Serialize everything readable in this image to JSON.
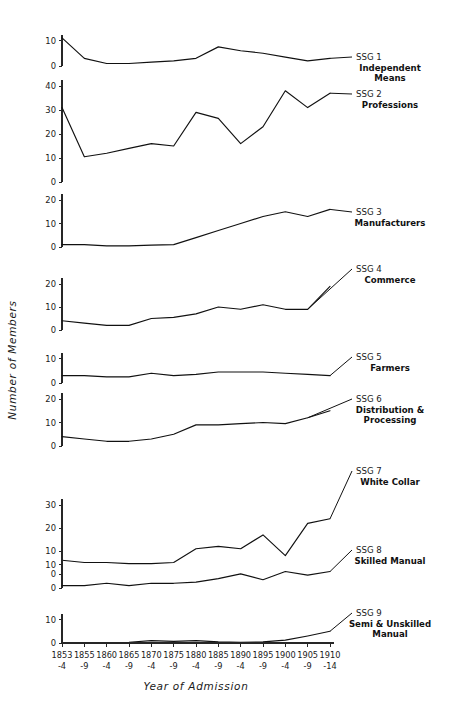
{
  "chart_data": {
    "type": "line",
    "title": "",
    "xlabel": "Year of Admission",
    "ylabel": "Number of Members",
    "grid": false,
    "legend_position": "right-inline",
    "categories": [
      "1853\n-4",
      "1855\n-9",
      "1860\n-4",
      "1865\n-9",
      "1870\n-4",
      "1875\n-9",
      "1880\n-4",
      "1885\n-9",
      "1890\n-4",
      "1895\n-9",
      "1900\n-4",
      "1905\n-9",
      "1910\n-14"
    ],
    "xticks_top": [
      "1853",
      "1855",
      "1860",
      "1865",
      "1870",
      "1875",
      "1880",
      "1885",
      "1890",
      "1895",
      "1900",
      "1905",
      "1910"
    ],
    "xticks_bottom": [
      "-4",
      "-9",
      "-4",
      "-9",
      "-4",
      "-9",
      "-4",
      "-9",
      "-4",
      "-9",
      "-4",
      "-9",
      "-14"
    ],
    "panels": [
      {
        "code": "SSG 1",
        "name": "Independent\nMeans",
        "name_lines": [
          "Independent",
          "Means"
        ],
        "yticks": [
          0,
          10
        ],
        "ylim": [
          0,
          13
        ],
        "values": [
          11,
          3,
          1,
          1,
          1.5,
          2,
          3,
          7.5,
          6,
          5,
          3.5,
          2,
          3
        ]
      },
      {
        "code": "SSG 2",
        "name": "Professions",
        "name_lines": [
          "Professions"
        ],
        "yticks": [
          0,
          10,
          20,
          30,
          40
        ],
        "ylim": [
          0,
          44
        ],
        "values": [
          31,
          10.5,
          12,
          14,
          16,
          15,
          29,
          26.5,
          16,
          23,
          38,
          31,
          37
        ]
      },
      {
        "code": "SSG 3",
        "name": "Manufacturers",
        "name_lines": [
          "Manufacturers"
        ],
        "yticks": [
          0,
          10,
          20
        ],
        "ylim": [
          0,
          22
        ],
        "values": [
          1,
          1,
          0.5,
          0.5,
          0.8,
          1,
          4,
          7,
          10,
          13,
          15,
          13,
          16
        ]
      },
      {
        "code": "SSG 4",
        "name": "Commerce",
        "name_lines": [
          "Commerce"
        ],
        "yticks": [
          0,
          10,
          20
        ],
        "ylim": [
          0,
          22
        ],
        "values": [
          4,
          3,
          2,
          2,
          5,
          5.5,
          7,
          10,
          9,
          11,
          9,
          9,
          19
        ]
      },
      {
        "code": "SSG 5",
        "name": "Farmers",
        "name_lines": [
          "Farmers"
        ],
        "yticks": [
          0,
          10
        ],
        "ylim": [
          0,
          12
        ],
        "values": [
          3,
          3,
          2.5,
          2.5,
          4,
          3,
          3.5,
          4.5,
          4.5,
          4.5,
          4,
          3.5,
          3
        ]
      },
      {
        "code": "SSG 6",
        "name": "Distribution &\nProcessing",
        "name_lines": [
          "Distribution &",
          "Processing"
        ],
        "yticks": [
          0,
          10,
          20
        ],
        "ylim": [
          0,
          22
        ],
        "values": [
          4,
          3,
          2,
          2,
          3,
          5,
          9,
          9,
          9.5,
          10,
          9.5,
          12,
          15
        ]
      },
      {
        "code": "SSG 7",
        "name": "White Collar",
        "name_lines": [
          "White Collar"
        ],
        "yticks": [
          0,
          10,
          20,
          30
        ],
        "ylim": [
          0,
          33
        ],
        "values": [
          6,
          5,
          5,
          4.5,
          4.5,
          5,
          11,
          12,
          11,
          17,
          8,
          22,
          24
        ]
      },
      {
        "code": "SSG 8",
        "name": "Skilled Manual",
        "name_lines": [
          "Skilled Manual"
        ],
        "yticks": [
          0,
          10
        ],
        "ylim": [
          0,
          13
        ],
        "values": [
          1,
          1,
          2,
          1,
          2,
          2,
          2.5,
          4,
          6,
          3.5,
          7,
          5.5,
          7
        ]
      },
      {
        "code": "SSG 9",
        "name": "Semi & Unskilled\nManual",
        "name_lines": [
          "Semi & Unskilled",
          "Manual"
        ],
        "yticks": [
          0,
          10
        ],
        "ylim": [
          0,
          13
        ],
        "values": [
          0,
          0,
          0,
          0.3,
          1,
          0.7,
          1,
          0.5,
          0.3,
          0.5,
          1.2,
          3,
          5
        ]
      }
    ]
  },
  "layout": {
    "plot_left": 62,
    "plot_right": 330,
    "y_axis_title_x": 16,
    "x_axis_title_y": 688
  }
}
